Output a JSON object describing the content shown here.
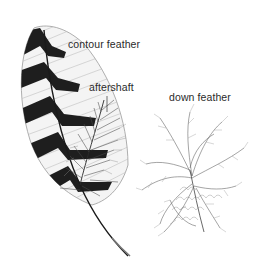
{
  "diagram": {
    "labels": {
      "contour": "contour feather",
      "aftershaft": "aftershaft",
      "down": "down feather"
    },
    "parts": [
      {
        "name": "contour feather",
        "description": "large vaned feather with dark chevron barring and central shaft"
      },
      {
        "name": "aftershaft",
        "description": "plumaceous secondary shaft attached at base of contour feather"
      },
      {
        "name": "down feather",
        "description": "fluffy feather with loose barbs"
      }
    ],
    "colors": {
      "background": "#ffffff",
      "ink": "#1e1e1e",
      "light_ink": "#8a8a8a",
      "label_text": "#2a2a2a"
    }
  }
}
